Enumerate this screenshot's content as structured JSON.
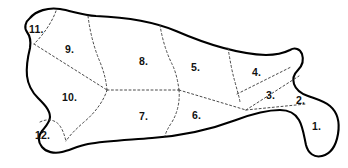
{
  "diagram": {
    "type": "butcher-cuts-chart",
    "orientation": "head-left",
    "colors": {
      "background": "#ffffff",
      "outline": "#000000",
      "divider": "#4a4a4a",
      "label_text": "#111111"
    },
    "outline": {
      "stroke_width": 2.1,
      "style": "solid"
    },
    "dividers": {
      "stroke_width": 1,
      "style": "dashed",
      "dash_pattern": "2,2.4"
    },
    "regions": [
      {
        "id": 1,
        "label": "1.",
        "label_x": 312,
        "label_y": 121,
        "position": "hind-leg-lower-right"
      },
      {
        "id": 2,
        "label": "2.",
        "label_x": 296,
        "label_y": 95,
        "position": "hind-upper-right-small"
      },
      {
        "id": 3,
        "label": "3.",
        "label_x": 266,
        "label_y": 90,
        "position": "hind-mid-right"
      },
      {
        "id": 4,
        "label": "4.",
        "label_x": 252,
        "label_y": 67,
        "position": "hind-top-right"
      },
      {
        "id": 5,
        "label": "5.",
        "label_x": 191,
        "label_y": 62,
        "position": "upper-mid-right"
      },
      {
        "id": 6,
        "label": "6.",
        "label_x": 192,
        "label_y": 110,
        "position": "lower-mid-right"
      },
      {
        "id": 7,
        "label": "7.",
        "label_x": 139,
        "label_y": 111,
        "position": "lower-middle"
      },
      {
        "id": 8,
        "label": "8.",
        "label_x": 139,
        "label_y": 56,
        "position": "upper-middle"
      },
      {
        "id": 9,
        "label": "9.",
        "label_x": 65,
        "label_y": 44,
        "position": "upper-left"
      },
      {
        "id": 10,
        "label": "10.",
        "label_x": 62,
        "label_y": 92,
        "position": "lower-left"
      },
      {
        "id": 11,
        "label": "11.",
        "label_x": 29,
        "label_y": 24,
        "position": "top-left-corner"
      },
      {
        "id": 12,
        "label": "12.",
        "label_x": 35,
        "label_y": 130,
        "position": "bottom-left-foreshank"
      }
    ]
  }
}
